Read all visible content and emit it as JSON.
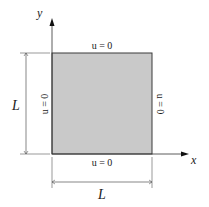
{
  "diagram": {
    "axes": {
      "x_label": "x",
      "y_label": "y"
    },
    "square": {
      "fill": "#c9c9c9",
      "stroke": "#3a3a3a"
    },
    "boundary_conditions": {
      "top": "u = 0",
      "bottom": "u = 0",
      "left": "u = 0",
      "right": "u = 0"
    },
    "dimensions": {
      "height_label": "L",
      "width_label": "L"
    }
  }
}
